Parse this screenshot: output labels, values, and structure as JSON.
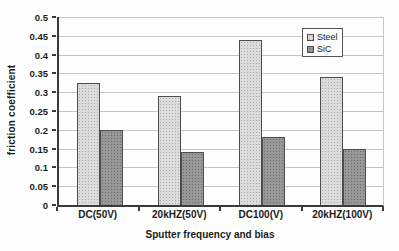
{
  "chart_data": {
    "type": "bar",
    "title": "",
    "xlabel": "Sputter frequency and bias",
    "ylabel": "friction coefficient",
    "categories": [
      "DC(50V)",
      "20kHZ(50V)",
      "DC100(V)",
      "20kHZ(100V)"
    ],
    "series": [
      {
        "name": "Steel",
        "color": "#dcdcdc",
        "values": [
          0.325,
          0.29,
          0.44,
          0.34
        ]
      },
      {
        "name": "SiC",
        "color": "#989898",
        "values": [
          0.2,
          0.14,
          0.18,
          0.148
        ]
      }
    ],
    "ylim": [
      0,
      0.5
    ],
    "ytick_step": 0.05,
    "yticks": [
      "0",
      "0.05",
      "0.1",
      "0.15",
      "0.2",
      "0.25",
      "0.3",
      "0.35",
      "0.4",
      "0.45",
      "0.5"
    ],
    "grid": "horizontal",
    "legend_position": "top-right-inside",
    "colors": {
      "gridline": "#c6c6c6",
      "axis": "#3a3a3a",
      "bar_border": "#4d4d4d",
      "text": "#1b1b1b",
      "background": "#fefefe"
    }
  }
}
